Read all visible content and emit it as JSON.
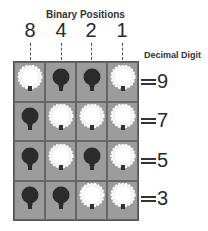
{
  "header": {
    "title": "Binary Positions",
    "decimal_label": "Decimal Digit",
    "positions": [
      "8",
      "4",
      "2",
      "1"
    ]
  },
  "rows": [
    {
      "bits": [
        1,
        0,
        0,
        1
      ],
      "value": "9"
    },
    {
      "bits": [
        0,
        1,
        1,
        1
      ],
      "value": "7"
    },
    {
      "bits": [
        0,
        1,
        0,
        1
      ],
      "value": "5"
    },
    {
      "bits": [
        0,
        0,
        1,
        1
      ],
      "value": "3"
    }
  ],
  "legend": {
    "on": "lit-bulb-icon",
    "off": "dark-bulb-icon"
  },
  "colors": {
    "cell": "#9c9c9c",
    "bulb_off": "#2b2b2b",
    "bulb_on": "#ffffff",
    "grid_line": "#555555"
  }
}
